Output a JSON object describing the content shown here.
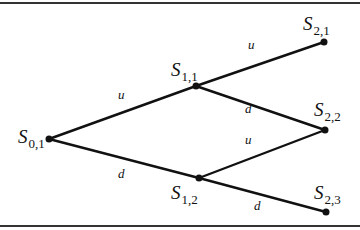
{
  "diagram": {
    "type": "binomial-tree",
    "colors": {
      "line": "#111111",
      "border": "#333333",
      "background": "#ffffff"
    },
    "nodes": [
      {
        "id": "S01",
        "symbol": "S",
        "sub": "0,1",
        "x": 49,
        "y": 139
      },
      {
        "id": "S11",
        "symbol": "S",
        "sub": "1,1",
        "x": 196,
        "y": 86
      },
      {
        "id": "S12",
        "symbol": "S",
        "sub": "1,2",
        "x": 199,
        "y": 178
      },
      {
        "id": "S21",
        "symbol": "S",
        "sub": "2,1",
        "x": 324,
        "y": 42
      },
      {
        "id": "S22",
        "symbol": "S",
        "sub": "2,2",
        "x": 325,
        "y": 130
      },
      {
        "id": "S23",
        "symbol": "S",
        "sub": "2,3",
        "x": 326,
        "y": 212
      }
    ],
    "edges": [
      {
        "from": "S01",
        "to": "S11",
        "label": "u"
      },
      {
        "from": "S01",
        "to": "S12",
        "label": "d"
      },
      {
        "from": "S11",
        "to": "S21",
        "label": "u"
      },
      {
        "from": "S11",
        "to": "S22",
        "label": "d"
      },
      {
        "from": "S12",
        "to": "S22",
        "label": "u"
      },
      {
        "from": "S12",
        "to": "S23",
        "label": "d"
      }
    ]
  }
}
